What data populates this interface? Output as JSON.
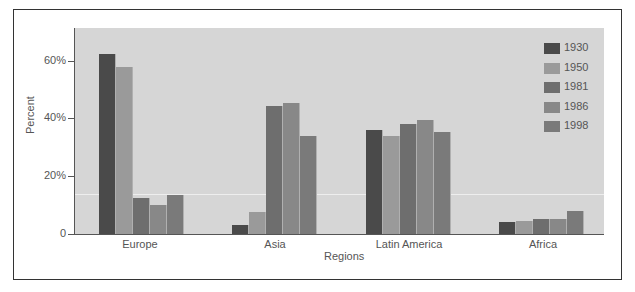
{
  "chart_data": {
    "type": "bar",
    "title": "",
    "xlabel": "Regions",
    "ylabel": "Percent",
    "ylim": [
      0,
      70
    ],
    "y_ticks": [
      "0",
      "20%",
      "40%",
      "60%"
    ],
    "categories": [
      "Europe",
      "Asia",
      "Latin America",
      "Africa"
    ],
    "series": [
      {
        "name": "1930",
        "color": "#4a4a4a",
        "values": [
          62.5,
          3,
          36,
          4.2
        ]
      },
      {
        "name": "1950",
        "color": "#9a9a9a",
        "values": [
          58,
          7.5,
          34,
          4.4
        ]
      },
      {
        "name": "1981",
        "color": "#6e6e6e",
        "values": [
          12.5,
          44.5,
          38,
          5.3
        ]
      },
      {
        "name": "1986",
        "color": "#888888",
        "values": [
          10,
          45.5,
          39.5,
          5.1
        ]
      },
      {
        "name": "1998",
        "color": "#7a7a7a",
        "values": [
          13.5,
          34,
          35.3,
          7.9
        ]
      }
    ],
    "legend_position": "top-right",
    "grid": false
  }
}
